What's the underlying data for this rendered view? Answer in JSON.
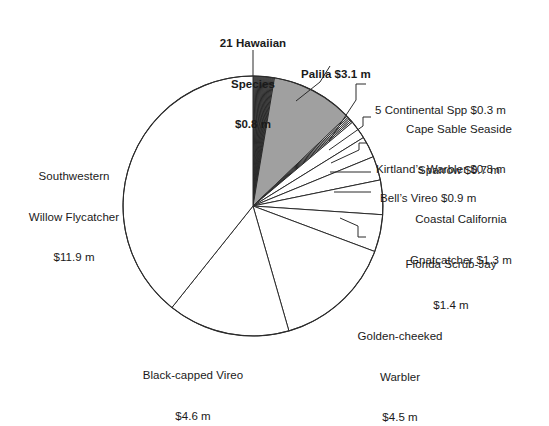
{
  "chart_data": {
    "type": "pie",
    "title": "",
    "units": "millions of dollars",
    "total": 30.5,
    "categories": [
      "21 Hawaiian Species",
      "Palila",
      "5 Continental Spp",
      "Cape Sable Seaside Sparrow",
      "Kirtland's Warbler",
      "Bell's Vireo",
      "Coastal California Gnatcatcher",
      "Florida Scrub-Jay",
      "Golden-cheeked Warbler",
      "Black-capped Vireo",
      "Southwestern Willow Flycatcher"
    ],
    "values": [
      0.8,
      3.1,
      0.3,
      0.7,
      0.8,
      0.9,
      1.3,
      1.4,
      4.5,
      4.6,
      11.9
    ],
    "value_labels": [
      "$0.8 m",
      "$3.1 m",
      "$0.3 m",
      "$0.7 m",
      "$0.8 m",
      "$0.9 m",
      "$1.3 m",
      "$1.4 m",
      "$4.5 m",
      "$4.6 m",
      "$11.9 m"
    ],
    "slice_colors": [
      "#ffffff",
      "#a0a0a0",
      "#ffffff",
      "#ffffff",
      "#ffffff",
      "#ffffff",
      "#ffffff",
      "#ffffff",
      "#ffffff",
      "#ffffff",
      "#ffffff"
    ],
    "stroke_color": "#2b2b2b",
    "legend": "none",
    "grid": false,
    "start_angle_deg": 0,
    "direction": "clockwise",
    "subslices": {
      "21 Hawaiian Species": 21,
      "5 Continental Spp": 5
    }
  },
  "labels": {
    "hawaiian": {
      "line1": "21 Hawaiian",
      "line2": "Species",
      "line3": "$0.8 m"
    },
    "palila": {
      "line1": "Palila $3.1 m"
    },
    "continental": {
      "line1": "5 Continental Spp $0.3 m"
    },
    "cape_sable": {
      "line1": "Cape Sable Seaside",
      "line2": "Sparrow $0.7 m"
    },
    "kirtland": {
      "line1": "Kirtland’s Warbler $0.8 m"
    },
    "bells_vireo": {
      "line1": "Bell’s Vireo $0.9 m"
    },
    "gnatcatcher": {
      "line1": "Coastal California",
      "line2": "Gnatcatcher $1.3 m"
    },
    "scrub_jay": {
      "line1": "Florida Scrub-Jay",
      "line2": "$1.4 m"
    },
    "golden_cheeked": {
      "line1": "Golden-cheeked",
      "line2": "Warbler",
      "line3": "$4.5 m"
    },
    "black_capped": {
      "line1": "Black-capped Vireo",
      "line2": "$4.6 m"
    },
    "flycatcher": {
      "line1": "Southwestern",
      "line2": "Willow Flycatcher",
      "line3": "$11.9 m"
    }
  }
}
